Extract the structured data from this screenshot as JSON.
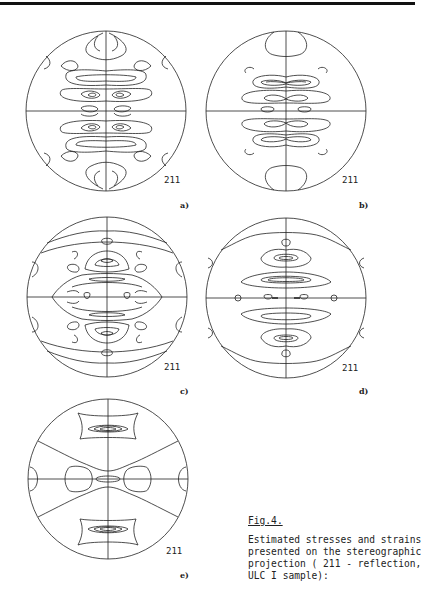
{
  "figure": {
    "number_label": "Fig.4.",
    "caption_lines": [
      "Estimated stresses and strains",
      "presented on the stereographic",
      "projection ( 211 - reflection,",
      "ULC I sample):"
    ],
    "panels": [
      {
        "id": "a",
        "letter": "a)",
        "reflection": "211"
      },
      {
        "id": "b",
        "letter": "b)",
        "reflection": "211"
      },
      {
        "id": "c",
        "letter": "c)",
        "reflection": "211"
      },
      {
        "id": "d",
        "letter": "d)",
        "reflection": "211"
      },
      {
        "id": "e",
        "letter": "e)",
        "reflection": "211"
      }
    ]
  }
}
